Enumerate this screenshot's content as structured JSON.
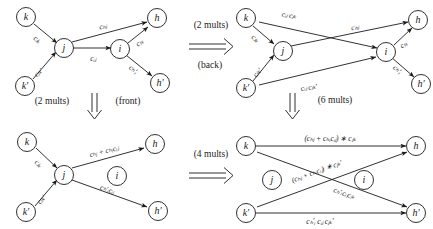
{
  "figure": {
    "nodes": {
      "k": "k",
      "kp": "k′",
      "j": "j",
      "i": "i",
      "h": "h",
      "hp": "h′"
    },
    "panels": {
      "top_left": {
        "name": "original-graph",
        "edges": [
          {
            "from": "k",
            "to": "j",
            "label": "cⱼₖ",
            "label_main": "c",
            "sub": "jk"
          },
          {
            "from": "k′",
            "to": "j",
            "label": "cⱼₖ′",
            "label_main": "c",
            "sub": "jk′"
          },
          {
            "from": "j",
            "to": "h",
            "label": "cₕⱼ",
            "label_main": "c",
            "sub": "hj"
          },
          {
            "from": "j",
            "to": "i",
            "label": "cᵢⱼ",
            "label_main": "c",
            "sub": "ij"
          },
          {
            "from": "i",
            "to": "h",
            "label": "cₕᵢ",
            "label_main": "c",
            "sub": "hi"
          },
          {
            "from": "i",
            "to": "h′",
            "label": "cₕ′ᵢ",
            "label_main": "c",
            "sub": "h′i"
          }
        ]
      },
      "top_right": {
        "name": "back-eliminated-graph",
        "edges": [
          {
            "from": "k",
            "to": "i",
            "label": "cᵢⱼ cⱼₖ"
          },
          {
            "from": "k",
            "to": "j",
            "label": "cⱼₖ"
          },
          {
            "from": "k′",
            "to": "j",
            "label": "cⱼₖ′"
          },
          {
            "from": "k′",
            "to": "i",
            "label": "cᵢⱼ cⱼₖ′"
          },
          {
            "from": "j",
            "to": "h",
            "label": "cₕⱼ"
          },
          {
            "from": "i",
            "to": "h",
            "label": "cₕᵢ"
          },
          {
            "from": "i",
            "to": "h′",
            "label": "cₕ′ᵢ"
          }
        ]
      },
      "bottom_left": {
        "name": "front-eliminated-graph",
        "edges": [
          {
            "from": "k",
            "to": "j",
            "label": "cⱼₖ"
          },
          {
            "from": "k′",
            "to": "j",
            "label": "cⱼₖ′"
          },
          {
            "from": "j",
            "to": "h",
            "label": "cₕⱼ + cₕᵢcᵢⱼ"
          },
          {
            "from": "j",
            "to": "h′",
            "label": "cₕ′ᵢcᵢⱼ"
          }
        ]
      },
      "bottom_right": {
        "name": "fully-eliminated-graph",
        "edges": [
          {
            "from": "k",
            "to": "h",
            "label": "(cₕⱼ + cₕᵢcᵢⱼ) ∗ cⱼₖ"
          },
          {
            "from": "k",
            "to": "h′",
            "label": "cₕ′ᵢcᵢⱼcⱼₖ"
          },
          {
            "from": "k′",
            "to": "h",
            "label": "(cₕⱼ + cₕᵢcᵢⱼ) ∗ cⱼₖ′"
          },
          {
            "from": "k′",
            "to": "h′",
            "label": "cₕ′ᵢ cᵢⱼ cⱼₖ′"
          }
        ]
      }
    },
    "transitions": {
      "top_right_arrow": {
        "name": "back-elimination-arrow",
        "cost": "(2 mults)",
        "cost_count": "2",
        "cost_unit": "mults",
        "direction": "back",
        "direction_label": "(back)",
        "glyph": "⟹"
      },
      "left_down_arrow": {
        "name": "front-elimination-arrow",
        "cost": "(2 mults)",
        "cost_count": "2",
        "cost_unit": "mults",
        "direction": "front",
        "direction_label": "(front)",
        "glyph": "⇓"
      },
      "right_down_arrow": {
        "name": "six-mults-arrow",
        "cost": "(6 mults)",
        "cost_count": "6",
        "cost_unit": "mults",
        "glyph": "⇓"
      },
      "bottom_right_arrow": {
        "name": "four-mults-arrow",
        "cost": "(4 mults)",
        "cost_count": "4",
        "cost_unit": "mults",
        "glyph": "⟹"
      }
    },
    "colors": {
      "ink": "#1a1a1a",
      "background": "#ffffff"
    }
  }
}
